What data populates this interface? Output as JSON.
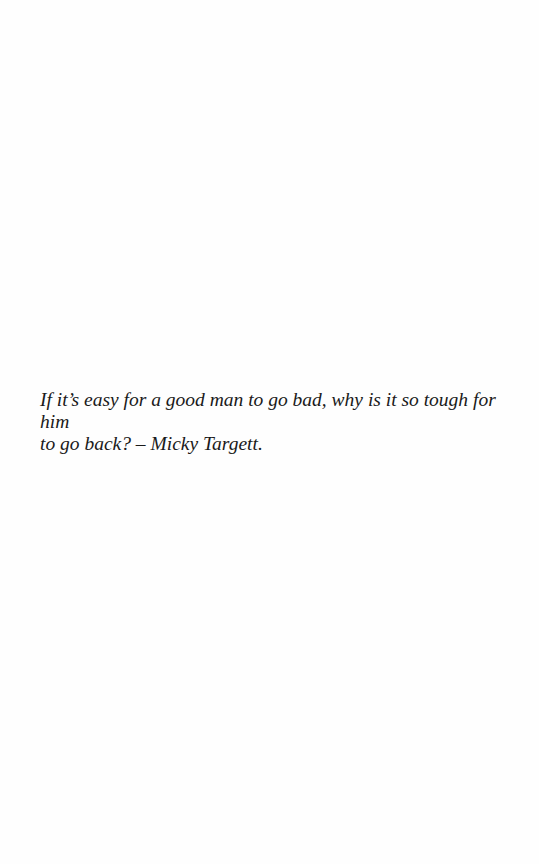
{
  "page": {
    "quote": {
      "line1": "If it’s easy for a good man to go bad, why is it so tough for him",
      "line2": "to go back? – Micky Targett."
    }
  }
}
